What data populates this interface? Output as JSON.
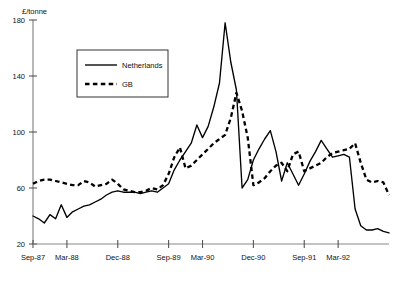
{
  "chart_data": {
    "type": "line",
    "title": "",
    "xlabel": "",
    "ylabel": "£/tonne",
    "ylim": [
      20,
      180
    ],
    "yticks": [
      20,
      60,
      100,
      140,
      180
    ],
    "ytick_labels": [
      "20",
      "60",
      "100",
      "140",
      "180"
    ],
    "grid": false,
    "legend_position": "upper-left-inset",
    "x_axis_note": "monthly observations, Sep-87 to Dec-92",
    "xtick_labels": [
      "Sep-87",
      "Mar-88",
      "Dec-88",
      "Sep-89",
      "Mar-90",
      "Dec-90",
      "Sep-91",
      "Mar-92"
    ],
    "xtick_indices": [
      0,
      6,
      15,
      24,
      30,
      39,
      48,
      54
    ],
    "x": [
      "Sep-87",
      "Oct-87",
      "Nov-87",
      "Dec-87",
      "Jan-88",
      "Feb-88",
      "Mar-88",
      "Apr-88",
      "May-88",
      "Jun-88",
      "Jul-88",
      "Aug-88",
      "Sep-88",
      "Oct-88",
      "Nov-88",
      "Dec-88",
      "Jan-89",
      "Feb-89",
      "Mar-89",
      "Apr-89",
      "May-89",
      "Jun-89",
      "Jul-89",
      "Aug-89",
      "Sep-89",
      "Oct-89",
      "Nov-89",
      "Dec-89",
      "Jan-90",
      "Feb-90",
      "Mar-90",
      "Apr-90",
      "May-90",
      "Jun-90",
      "Jul-90",
      "Aug-90",
      "Sep-90",
      "Oct-90",
      "Nov-90",
      "Dec-90",
      "Jan-91",
      "Feb-91",
      "Mar-91",
      "Apr-91",
      "May-91",
      "Jun-91",
      "Jul-91",
      "Aug-91",
      "Sep-91",
      "Oct-91",
      "Nov-91",
      "Dec-91",
      "Jan-92",
      "Feb-92",
      "Mar-92",
      "Apr-92",
      "May-92",
      "Jun-92",
      "Jul-92",
      "Aug-92",
      "Sep-92",
      "Oct-92",
      "Nov-92",
      "Dec-92"
    ],
    "series": [
      {
        "name": "Netherlands",
        "style": "solid",
        "color": "#000000",
        "values": [
          40,
          38,
          35,
          41,
          38,
          48,
          39,
          43,
          45,
          47,
          48,
          50,
          52,
          55,
          57,
          58,
          57,
          57,
          57,
          56,
          57,
          58,
          57,
          60,
          63,
          73,
          80,
          86,
          92,
          105,
          96,
          104,
          118,
          135,
          178,
          150,
          130,
          60,
          66,
          80,
          88,
          95,
          101,
          86,
          65,
          78,
          70,
          62,
          70,
          79,
          86,
          94,
          88,
          82,
          83,
          84,
          82,
          45,
          33,
          30,
          30,
          31,
          29,
          28
        ]
      },
      {
        "name": "GB",
        "style": "dashed",
        "color": "#000000",
        "values": [
          63,
          65,
          66,
          66,
          65,
          64,
          63,
          62,
          62,
          65,
          64,
          61,
          62,
          63,
          66,
          63,
          59,
          58,
          57,
          57,
          58,
          60,
          59,
          62,
          70,
          82,
          89,
          74,
          76,
          80,
          84,
          88,
          92,
          95,
          98,
          110,
          128,
          115,
          96,
          62,
          64,
          67,
          72,
          76,
          78,
          72,
          84,
          86,
          72,
          74,
          76,
          78,
          82,
          85,
          86,
          87,
          88,
          92,
          78,
          66,
          64,
          65,
          64,
          55
        ]
      }
    ]
  },
  "legend": {
    "items": [
      {
        "label": "Netherlands",
        "style": "solid"
      },
      {
        "label": "GB",
        "style": "dashed"
      }
    ]
  },
  "axis": {
    "unit_label": "£/tonne"
  }
}
